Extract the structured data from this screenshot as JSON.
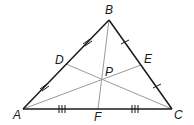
{
  "diagram": {
    "type": "triangle-medians",
    "colors": {
      "side": "#1a1a1a",
      "median": "#9a9a9a",
      "background": "#ffffff"
    },
    "vertices": {
      "A": {
        "label": "A",
        "x": 23,
        "y": 109,
        "lx": 13,
        "ly": 119
      },
      "B": {
        "label": "B",
        "x": 109,
        "y": 20,
        "lx": 105,
        "ly": 14
      },
      "C": {
        "label": "C",
        "x": 172,
        "y": 109,
        "lx": 174,
        "ly": 119
      }
    },
    "midpoints": {
      "D": {
        "label": "D",
        "x": 66,
        "y": 64,
        "lx": 55,
        "ly": 64
      },
      "E": {
        "label": "E",
        "x": 141,
        "y": 65,
        "lx": 144,
        "ly": 63
      },
      "F": {
        "label": "F",
        "x": 98,
        "y": 109,
        "lx": 94,
        "ly": 121
      }
    },
    "centroid": {
      "label": "P",
      "x": 102,
      "y": 79,
      "lx": 105,
      "ly": 76
    },
    "tick_marks": {
      "AB": 2,
      "BC": 1,
      "AC": 3
    }
  }
}
